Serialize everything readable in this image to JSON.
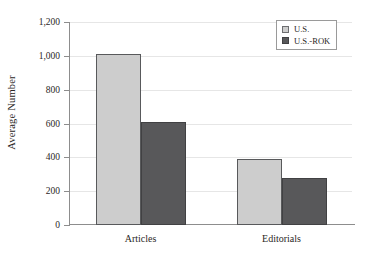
{
  "chart_data": {
    "type": "bar",
    "title": "",
    "xlabel": "",
    "ylabel": "Average Number",
    "categories": [
      "Articles",
      "Editorials"
    ],
    "series": [
      {
        "name": "U.S.",
        "values": [
          1010,
          390
        ],
        "color": "#cdcdcd"
      },
      {
        "name": "U.S.-ROK",
        "values": [
          610,
          280
        ],
        "color": "#58585a"
      }
    ],
    "ylim": [
      0,
      1200
    ],
    "yticks": [
      0,
      200,
      400,
      600,
      800,
      1000,
      1200
    ],
    "ytick_labels": [
      "0",
      "200",
      "400",
      "600",
      "800",
      "1,000",
      "1,200"
    ],
    "grid": true,
    "legend_position": "top-right"
  }
}
